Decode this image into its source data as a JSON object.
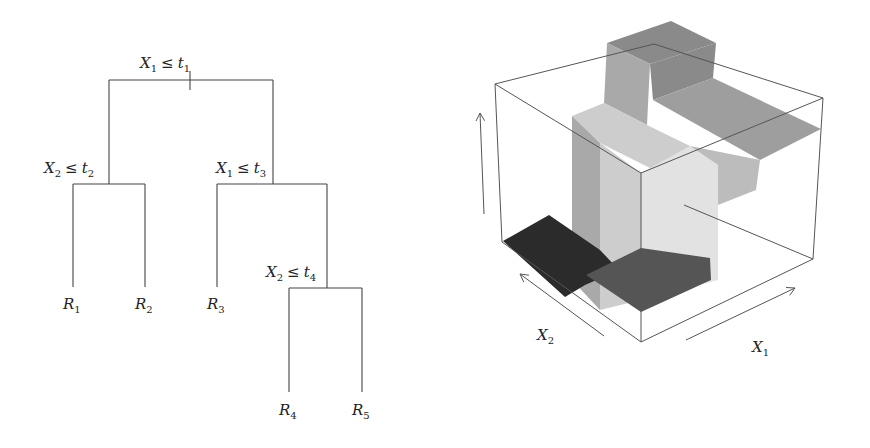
{
  "tree": {
    "nodes": [
      {
        "id": "root",
        "var": "X",
        "var_sub": "1",
        "op": "≤",
        "thr": "t",
        "thr_sub": "1",
        "label_x": 140,
        "label_y": 68,
        "bar": {
          "y": 80,
          "x1": 109,
          "x2": 273
        },
        "tick": {
          "x": 190,
          "y1": 71,
          "y2": 90
        }
      },
      {
        "id": "n2",
        "var": "X",
        "var_sub": "2",
        "op": "≤",
        "thr": "t",
        "thr_sub": "2",
        "label_x": 44,
        "label_y": 173,
        "stem": {
          "x": 109,
          "y1": 80,
          "y2": 184
        },
        "bar": {
          "y": 184,
          "x1": 73,
          "x2": 145
        }
      },
      {
        "id": "n3",
        "var": "X",
        "var_sub": "1",
        "op": "≤",
        "thr": "t",
        "thr_sub": "3",
        "label_x": 216,
        "label_y": 173,
        "stem": {
          "x": 273,
          "y1": 80,
          "y2": 184
        },
        "bar": {
          "y": 184,
          "x1": 217,
          "x2": 327
        }
      },
      {
        "id": "n4",
        "var": "X",
        "var_sub": "2",
        "op": "≤",
        "thr": "t",
        "thr_sub": "4",
        "label_x": 266,
        "label_y": 277,
        "stem": {
          "x": 327,
          "y1": 184,
          "y2": 288
        },
        "bar": {
          "y": 288,
          "x1": 289,
          "x2": 362
        }
      }
    ],
    "leaves": [
      {
        "id": "R1",
        "name": "R",
        "sub": "1",
        "x": 73,
        "y1": 184,
        "y2": 287,
        "label_y": 309
      },
      {
        "id": "R2",
        "name": "R",
        "sub": "2",
        "x": 145,
        "y1": 184,
        "y2": 287,
        "label_y": 309
      },
      {
        "id": "R3",
        "name": "R",
        "sub": "3",
        "x": 217,
        "y1": 184,
        "y2": 287,
        "label_y": 309
      },
      {
        "id": "R4",
        "name": "R",
        "sub": "4",
        "x": 289,
        "y1": 288,
        "y2": 392,
        "label_y": 415
      },
      {
        "id": "R5",
        "name": "R",
        "sub": "5",
        "x": 362,
        "y1": 288,
        "y2": 392,
        "label_y": 415
      }
    ]
  },
  "surface": {
    "axis_labels": {
      "x1": {
        "text": "X",
        "sub": "1",
        "x": 752,
        "y": 352
      },
      "x2": {
        "text": "X",
        "sub": "2",
        "x": 537,
        "y": 340
      }
    },
    "colors": {
      "top_dark": "#8a8a8a",
      "top_mid": "#9e9e9e",
      "side_mid": "#a9a9a9",
      "side_light": "#cdcdcd",
      "face_lightest": "#e2e2e2",
      "step_mid": "#bcbcbc",
      "floor_black": "#2b2b2b",
      "floor_dark": "#555555"
    },
    "polygons": [
      {
        "name": "back-high-top",
        "fill": "top_dark",
        "points": "607,43 671,21 716,43 650,64"
      },
      {
        "name": "back-high-front",
        "fill": "side_mid",
        "points": "607,43 650,64 647,125 604,103"
      },
      {
        "name": "back-high-right",
        "fill": "top_dark",
        "points": "650,64 716,43 713,78 653,100"
      },
      {
        "name": "right-plateau",
        "fill": "top_mid",
        "points": "653,100 713,78 821,129 760,160"
      },
      {
        "name": "left-column-top",
        "fill": "side_light",
        "points": "572,116 604,103 647,125 690,146 654,170 600,143"
      },
      {
        "name": "left-column-front",
        "fill": "side_mid",
        "points": "572,116 600,143 600,310 572,280"
      },
      {
        "name": "mid-column-front",
        "fill": "side_light",
        "points": "600,143 641,173 641,300 600,310"
      },
      {
        "name": "right-column-face",
        "fill": "face_lightest",
        "points": "641,173 690,146 718,165 718,280 641,300"
      },
      {
        "name": "step-face",
        "fill": "step_mid",
        "points": "690,146 760,160 756,190 718,205 718,165"
      },
      {
        "name": "floor-black",
        "fill": "floor_black",
        "points": "503,241 549,215 600,250 619,270 585,285 565,297"
      },
      {
        "name": "floor-dark",
        "fill": "floor_dark",
        "points": "586,275 641,248 710,258 711,280 641,312"
      }
    ],
    "box": {
      "corners": {
        "back_top_left": [
          495,
          84
        ],
        "back_top_right": [
          823,
          98
        ],
        "top_rear": [
          654,
          44
        ],
        "front_top": [
          641,
          173
        ],
        "back_bottom_left": [
          502,
          242
        ],
        "back_bottom_right": [
          813,
          259
        ],
        "front_bottom": [
          641,
          342
        ],
        "rear_bottom": [
          684,
          205
        ]
      }
    },
    "arrows": [
      {
        "name": "z-axis-arrow",
        "x1": 484,
        "y1": 214,
        "x2": 480,
        "y2": 113
      },
      {
        "name": "x2-axis-arrow",
        "x1": 604,
        "y1": 336,
        "x2": 520,
        "y2": 274
      },
      {
        "name": "x1-axis-arrow",
        "x1": 686,
        "y1": 340,
        "x2": 795,
        "y2": 288
      }
    ]
  }
}
